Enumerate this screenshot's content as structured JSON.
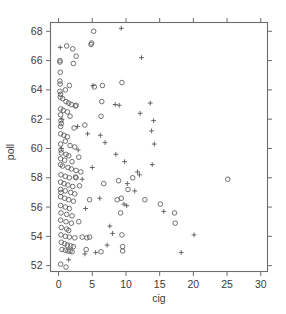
{
  "chart_data": {
    "type": "scatter",
    "title": "",
    "subtitle": "",
    "xlabel": "cig",
    "ylabel": "poll",
    "xlim": [
      -1.2,
      31.0
    ],
    "ylim": [
      51.6,
      68.6
    ],
    "xticks": [
      0,
      5,
      10,
      15,
      20,
      25,
      30
    ],
    "yticks": [
      52,
      54,
      56,
      58,
      60,
      62,
      64,
      66,
      68
    ],
    "xticklabels": [
      "0",
      "5",
      "10",
      "15",
      "20",
      "25",
      "30"
    ],
    "yticklabels": [
      "52",
      "54",
      "56",
      "58",
      "60",
      "62",
      "64",
      "66",
      "68"
    ],
    "grid": false,
    "legend": null,
    "frame": "box",
    "tick_direction": "out",
    "marker_colors": {
      "circle": "#585858",
      "plus": "#585858"
    },
    "series": [
      {
        "name": "circle",
        "marker": "open-circle",
        "points": [
          [
            5.2,
            68.0
          ],
          [
            4.8,
            67.1
          ],
          [
            4.9,
            67.2
          ],
          [
            1.2,
            67.0
          ],
          [
            2.1,
            66.8
          ],
          [
            2.6,
            66.3
          ],
          [
            0.2,
            66.0
          ],
          [
            0.2,
            65.9
          ],
          [
            2.2,
            65.8
          ],
          [
            0.25,
            65.2
          ],
          [
            0.2,
            64.6
          ],
          [
            0.22,
            64.4
          ],
          [
            1.6,
            64.3
          ],
          [
            5.3,
            64.2
          ],
          [
            6.5,
            64.3
          ],
          [
            9.4,
            64.5
          ],
          [
            0.3,
            63.7
          ],
          [
            0.25,
            63.5
          ],
          [
            0.6,
            63.4
          ],
          [
            1.1,
            63.2
          ],
          [
            1.5,
            63.1
          ],
          [
            1.9,
            63.0
          ],
          [
            2.5,
            62.9
          ],
          [
            2.6,
            62.95
          ],
          [
            6.4,
            63.2
          ],
          [
            0.3,
            62.7
          ],
          [
            0.7,
            62.6
          ],
          [
            1.3,
            62.5
          ],
          [
            0.3,
            62.3
          ],
          [
            1.7,
            62.2
          ],
          [
            6.3,
            62.2
          ],
          [
            0.35,
            61.9
          ],
          [
            0.4,
            61.7
          ],
          [
            0.3,
            61.5
          ],
          [
            2.3,
            61.4
          ],
          [
            3.9,
            61.6
          ],
          [
            0.3,
            61.0
          ],
          [
            0.8,
            60.9
          ],
          [
            1.3,
            60.8
          ],
          [
            1.0,
            60.5
          ],
          [
            0.3,
            60.3
          ],
          [
            1.7,
            60.2
          ],
          [
            2.4,
            60.1
          ],
          [
            0.35,
            59.9
          ],
          [
            0.4,
            59.7
          ],
          [
            1.1,
            59.6
          ],
          [
            1.5,
            59.5
          ],
          [
            0.3,
            59.3
          ],
          [
            0.9,
            59.2
          ],
          [
            2.0,
            59.1
          ],
          [
            3.0,
            59.4
          ],
          [
            0.3,
            58.9
          ],
          [
            0.6,
            58.8
          ],
          [
            1.4,
            58.7
          ],
          [
            1.9,
            58.6
          ],
          [
            2.6,
            58.5
          ],
          [
            3.3,
            58.4
          ],
          [
            0.35,
            58.2
          ],
          [
            1.0,
            58.1
          ],
          [
            1.6,
            58.0
          ],
          [
            2.5,
            58.05
          ],
          [
            2.6,
            58.0
          ],
          [
            0.3,
            57.7
          ],
          [
            0.8,
            57.6
          ],
          [
            1.4,
            57.5
          ],
          [
            2.1,
            57.4
          ],
          [
            3.1,
            57.45
          ],
          [
            6.7,
            57.6
          ],
          [
            8.9,
            57.8
          ],
          [
            0.3,
            57.2
          ],
          [
            0.35,
            57.0
          ],
          [
            1.0,
            57.1
          ],
          [
            1.8,
            57.0
          ],
          [
            2.4,
            56.9
          ],
          [
            0.3,
            56.7
          ],
          [
            0.9,
            56.6
          ],
          [
            1.5,
            56.5
          ],
          [
            2.2,
            56.4
          ],
          [
            4.6,
            56.5
          ],
          [
            8.7,
            56.5
          ],
          [
            9.3,
            56.6
          ],
          [
            0.3,
            56.1
          ],
          [
            1.0,
            56.0
          ],
          [
            1.6,
            55.9
          ],
          [
            0.35,
            55.6
          ],
          [
            1.2,
            55.5
          ],
          [
            2.0,
            55.4
          ],
          [
            9.2,
            55.6
          ],
          [
            0.3,
            55.1
          ],
          [
            1.1,
            55.0
          ],
          [
            1.9,
            54.9
          ],
          [
            3.0,
            55.0
          ],
          [
            0.4,
            54.6
          ],
          [
            1.2,
            54.5
          ],
          [
            1.5,
            54.4
          ],
          [
            0.35,
            54.1
          ],
          [
            1.0,
            54.0
          ],
          [
            1.6,
            53.95
          ],
          [
            2.4,
            53.9
          ],
          [
            3.5,
            53.95
          ],
          [
            4.2,
            53.9
          ],
          [
            4.6,
            53.95
          ],
          [
            9.4,
            54.1
          ],
          [
            0.4,
            53.6
          ],
          [
            0.9,
            53.5
          ],
          [
            1.3,
            53.4
          ],
          [
            1.8,
            53.35
          ],
          [
            2.2,
            53.3
          ],
          [
            0.5,
            53.1
          ],
          [
            1.0,
            53.05
          ],
          [
            1.4,
            53.0
          ],
          [
            1.7,
            53.0
          ],
          [
            2.0,
            52.95
          ],
          [
            4.1,
            53.1
          ],
          [
            6.3,
            52.95
          ],
          [
            9.5,
            53.3
          ],
          [
            9.5,
            53.0
          ],
          [
            0.3,
            52.1
          ],
          [
            1.1,
            51.9
          ],
          [
            15.1,
            56.2
          ],
          [
            17.2,
            55.6
          ],
          [
            17.3,
            54.9
          ],
          [
            25.1,
            57.9
          ],
          [
            12.8,
            56.5
          ],
          [
            10.3,
            57.2
          ],
          [
            11.0,
            58.0
          ],
          [
            0.2,
            63.9
          ],
          [
            1.0,
            64.0
          ]
        ]
      },
      {
        "name": "plus",
        "marker": "plus",
        "points": [
          [
            9.3,
            68.2
          ],
          [
            0.25,
            66.9
          ],
          [
            12.3,
            66.2
          ],
          [
            5.1,
            64.3
          ],
          [
            13.6,
            63.1
          ],
          [
            8.4,
            63.0
          ],
          [
            9.0,
            62.95
          ],
          [
            12.1,
            62.4
          ],
          [
            0.5,
            62.0
          ],
          [
            14.1,
            61.9
          ],
          [
            13.8,
            61.2
          ],
          [
            4.3,
            61.0
          ],
          [
            6.9,
            60.4
          ],
          [
            14.2,
            60.3
          ],
          [
            0.4,
            60.0
          ],
          [
            8.5,
            59.6
          ],
          [
            9.8,
            59.1
          ],
          [
            13.9,
            58.9
          ],
          [
            11.7,
            58.4
          ],
          [
            12.0,
            58.2
          ],
          [
            3.5,
            57.9
          ],
          [
            10.2,
            57.6
          ],
          [
            11.3,
            57.1
          ],
          [
            6.1,
            56.6
          ],
          [
            9.7,
            56.2
          ],
          [
            10.1,
            56.1
          ],
          [
            4.0,
            55.9
          ],
          [
            15.6,
            55.7
          ],
          [
            7.6,
            54.7
          ],
          [
            8.0,
            54.2
          ],
          [
            20.1,
            54.1
          ],
          [
            18.2,
            52.9
          ],
          [
            3.9,
            52.8
          ],
          [
            5.5,
            52.9
          ],
          [
            1.5,
            52.4
          ],
          [
            2.9,
            59.9
          ],
          [
            6.2,
            60.9
          ],
          [
            2.8,
            61.5
          ],
          [
            5.0,
            58.7
          ],
          [
            7.2,
            53.4
          ]
        ]
      }
    ]
  },
  "axes": {
    "xlabel": "cig",
    "ylabel": "poll"
  }
}
